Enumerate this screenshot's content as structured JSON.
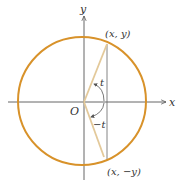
{
  "diagram": {
    "colors": {
      "circle": "#d8922a",
      "radius_line": "#e3c99a",
      "axis": "#555555",
      "text": "#333333"
    },
    "labels": {
      "y_axis": "y",
      "x_axis": "x",
      "origin": "O",
      "point_upper": "(x, y)",
      "point_lower": "(x, −y)",
      "angle_positive": "t",
      "angle_negative": "−t"
    }
  }
}
